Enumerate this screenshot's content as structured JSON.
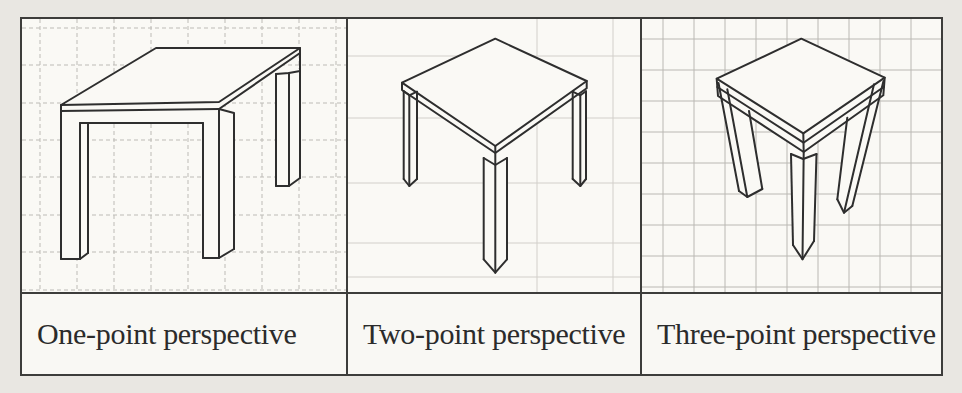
{
  "figure": {
    "panels": [
      {
        "id": "one-point",
        "caption": "One-point perspective",
        "drawing": "table-in-one-point-perspective-on-grid"
      },
      {
        "id": "two-point",
        "caption": "Two-point perspective",
        "drawing": "table-in-two-point-perspective-on-grid"
      },
      {
        "id": "three-point",
        "caption": "Three-point perspective",
        "drawing": "table-in-three-point-perspective-on-grid"
      }
    ],
    "colors": {
      "page_background": "#e9e7e2",
      "cell_background": "#faf9f5",
      "table_border": "#3d3d3b",
      "line_art": "#2e2e2e",
      "grid_panel_1": "#bdbbb6",
      "grid_panel_2": "#d2cfca",
      "grid_panel_3": "#bab8b3",
      "caption_text": "#2b2b2b"
    }
  }
}
